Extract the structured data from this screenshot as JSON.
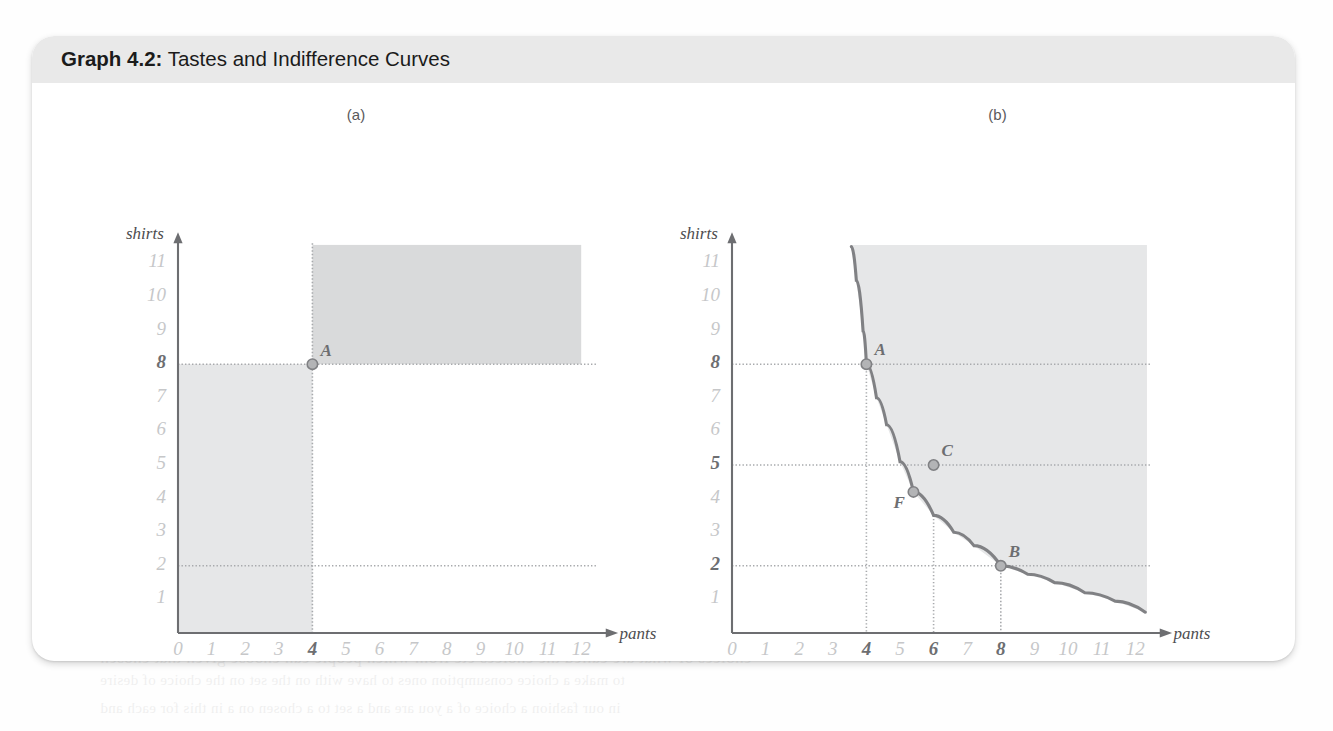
{
  "figure": {
    "number_label": "Graph 4.2:",
    "title": "Tastes and Indifference Curves",
    "panels": [
      {
        "label": "(a)"
      },
      {
        "label": "(b)"
      }
    ]
  },
  "ghost_text": [
    {
      "text": "that I choose 8 shirts to pants and shirts and can",
      "x": 590,
      "y": 38,
      "size": 15
    },
    {
      "text": "rather because it tells our models to view that ultimately are not in the outline by",
      "x": 600,
      "y": 60,
      "size": 15
    },
    {
      "text": "on one axis and all the rest of consumption on the other and",
      "x": 615,
      "y": 82,
      "size": 15
    },
    {
      "text": "the only way is to plot a small number of the choices a consumer might be",
      "x": 600,
      "y": 108,
      "size": 15
    },
    {
      "text": "and the all and cases but you will perhaps of your choices, these kinds",
      "x": 612,
      "y": 134,
      "size": 15
    },
    {
      "text": "questions in cases where the is, to create the desire",
      "x": 612,
      "y": 182,
      "size": 16
    },
    {
      "text": "a greater other ways of models of the that make up",
      "x": 606,
      "y": 210,
      "size": 16
    },
    {
      "text": "For instance, we might think",
      "x": 616,
      "y": 238,
      "size": 16
    },
    {
      "text": "cases fitting goods, it will",
      "x": 616,
      "y": 266,
      "size": 16
    },
    {
      "text": "goods that provide you",
      "x": 620,
      "y": 294,
      "size": 16
    },
    {
      "text": "is thinking but is not a part",
      "x": 600,
      "y": 322,
      "size": 16
    },
    {
      "text": "and will the same type",
      "x": 624,
      "y": 350,
      "size": 16
    },
    {
      "text": "that can think of you a",
      "x": 616,
      "y": 378,
      "size": 16
    },
    {
      "text": "required both to and",
      "x": 624,
      "y": 406,
      "size": 16
    },
    {
      "text": "the utilities of consumer",
      "x": 620,
      "y": 434,
      "size": 16
    },
    {
      "text": "and goods you think",
      "x": 626,
      "y": 462,
      "size": 16
    },
    {
      "text": "The Shaping Tastes",
      "x": 710,
      "y": 528,
      "size": 24
    },
    {
      "text": "choices of what are called the choices etc from which people can choose given that chosen",
      "x": 100,
      "y": 648,
      "size": 17
    },
    {
      "text": "to make a choice consumption ones to have with on the set on the choice of desire",
      "x": 100,
      "y": 672,
      "size": 15
    },
    {
      "text": "in our fashion a choice of a you are and a set to a chosen on a in this for each and",
      "x": 100,
      "y": 700,
      "size": 15
    }
  ],
  "chart_data": [
    {
      "type": "scatter",
      "panel": "(a)",
      "title": "(a)",
      "xlabel": "pants",
      "ylabel": "shirts",
      "xlim": [
        0,
        12.6
      ],
      "ylim": [
        0,
        11.9
      ],
      "xticks": [
        0,
        1,
        2,
        3,
        4,
        5,
        6,
        7,
        8,
        9,
        10,
        11,
        12
      ],
      "yticks": [
        1,
        2,
        3,
        4,
        5,
        6,
        7,
        8,
        9,
        10,
        11
      ],
      "highlighted_xticks": [
        4
      ],
      "highlighted_yticks": [
        8
      ],
      "grid": false,
      "legend": "none",
      "points": [
        {
          "label": "A",
          "x": 4,
          "y": 8
        }
      ],
      "guide_lines": [
        {
          "orientation": "horizontal",
          "value": 8,
          "style": "dotted"
        },
        {
          "orientation": "horizontal",
          "value": 2,
          "style": "dotted"
        },
        {
          "orientation": "vertical",
          "value": 4,
          "style": "dotted"
        }
      ],
      "shaded_regions": [
        {
          "name": "better-than-A",
          "x_from": 4,
          "x_to": 12,
          "y_from": 8,
          "y_to": 11.55,
          "shade": "dark"
        },
        {
          "name": "worse-than-A",
          "x_from": 0,
          "x_to": 4,
          "y_from": 0,
          "y_to": 8,
          "shade": "light"
        }
      ]
    },
    {
      "type": "line",
      "panel": "(b)",
      "title": "(b)",
      "xlabel": "pants",
      "ylabel": "shirts",
      "xlim": [
        0,
        12.6
      ],
      "ylim": [
        0,
        11.9
      ],
      "xticks": [
        0,
        1,
        2,
        3,
        4,
        5,
        6,
        7,
        8,
        9,
        10,
        11,
        12
      ],
      "yticks": [
        1,
        2,
        3,
        4,
        5,
        6,
        7,
        8,
        9,
        10,
        11
      ],
      "highlighted_xticks": [
        4,
        6,
        8
      ],
      "highlighted_yticks": [
        2,
        5,
        8
      ],
      "grid": false,
      "legend": "none",
      "series": [
        {
          "name": "indifference curve",
          "x": [
            3.55,
            3.7,
            3.9,
            4.0,
            4.3,
            4.6,
            5.0,
            5.4,
            6.0,
            6.6,
            7.2,
            8.0,
            8.8,
            9.6,
            10.5,
            11.4,
            12.3
          ],
          "y": [
            11.5,
            10.5,
            9.0,
            8.0,
            7.0,
            6.2,
            5.1,
            4.2,
            3.5,
            3.0,
            2.6,
            2.0,
            1.75,
            1.5,
            1.2,
            0.95,
            0.62
          ]
        }
      ],
      "points": [
        {
          "label": "A",
          "x": 4,
          "y": 8,
          "on_curve": true
        },
        {
          "label": "F",
          "x": 5.4,
          "y": 4.2,
          "on_curve": true
        },
        {
          "label": "C",
          "x": 6,
          "y": 5,
          "on_curve": false
        },
        {
          "label": "B",
          "x": 8,
          "y": 2,
          "on_curve": true
        }
      ],
      "guide_lines": [
        {
          "orientation": "horizontal",
          "value": 8,
          "style": "dotted"
        },
        {
          "orientation": "horizontal",
          "value": 5,
          "style": "dotted"
        },
        {
          "orientation": "horizontal",
          "value": 2,
          "style": "dotted"
        },
        {
          "orientation": "vertical",
          "value": 4,
          "style": "dotted"
        },
        {
          "orientation": "vertical",
          "value": 6,
          "style": "dotted"
        },
        {
          "orientation": "vertical",
          "value": 8,
          "style": "dotted"
        }
      ],
      "shaded_regions": [
        {
          "name": "preferred-to-A",
          "description": "region above and right of indifference curve",
          "shade": "light"
        }
      ]
    }
  ],
  "colors": {
    "header_band": "#e9e9e9",
    "title_text": "#1b1b1b",
    "axis": "#6d6e71",
    "tick_dim": "#c6c7c9",
    "tick_bold": "#6d6e71",
    "curve": "#808184",
    "shade_dark": "#d9dadb",
    "shade_light": "#e6e7e8",
    "point_fill": "#b3b4b6",
    "point_stroke": "#808184"
  }
}
